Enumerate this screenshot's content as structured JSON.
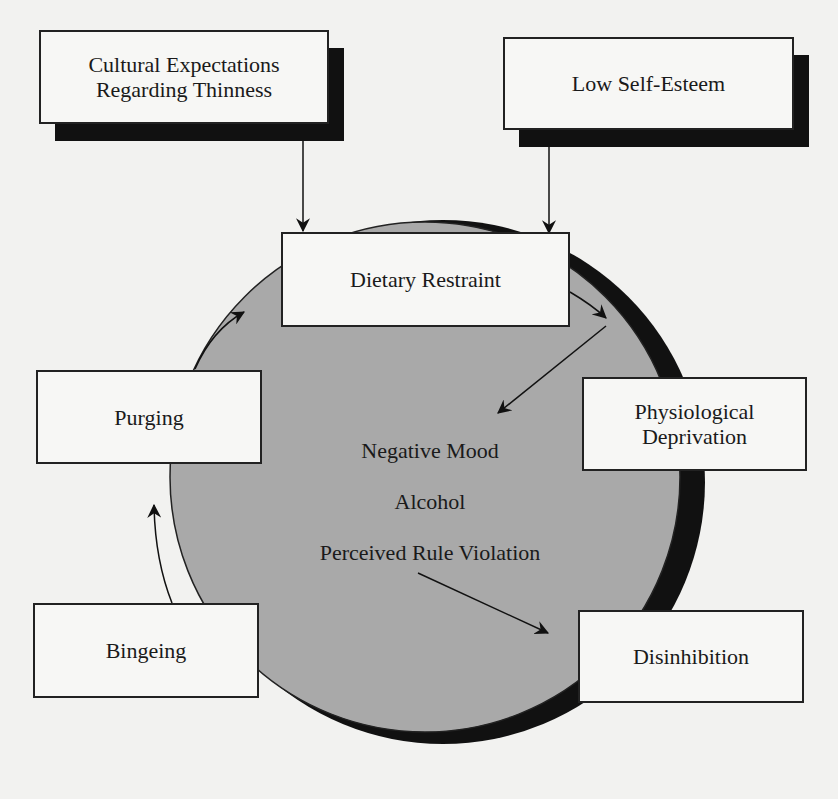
{
  "diagram": {
    "type": "cycle-flow",
    "nodes": {
      "cultural_expectations": "Cultural Expectations\nRegarding Thinness",
      "low_self_esteem": "Low Self-Esteem",
      "dietary_restraint": "Dietary Restraint",
      "physiological_deprivation": "Physiological\nDeprivation",
      "purging": "Purging",
      "bingeing": "Bingeing",
      "disinhibition": "Disinhibition"
    },
    "center_factors": [
      "Negative Mood",
      "Alcohol",
      "Perceived Rule Violation"
    ],
    "edges": [
      {
        "from": "Cultural Expectations Regarding Thinness",
        "to": "Dietary Restraint"
      },
      {
        "from": "Low Self-Esteem",
        "to": "Dietary Restraint"
      },
      {
        "from": "Dietary Restraint",
        "to": "Physiological Deprivation"
      },
      {
        "from": "Physiological Deprivation",
        "to": "Negative Mood"
      },
      {
        "from": "Perceived Rule Violation",
        "to": "Disinhibition"
      },
      {
        "from": "Disinhibition",
        "to": "Bingeing"
      },
      {
        "from": "Bingeing",
        "to": "Purging"
      },
      {
        "from": "Purging",
        "to": "Dietary Restraint"
      }
    ]
  },
  "colors": {
    "page": "#f2f2f0",
    "circle_fill": "#a9a9a9",
    "circle_shadow": "#111111",
    "box_fill": "#f7f7f5",
    "stroke": "#222222"
  }
}
